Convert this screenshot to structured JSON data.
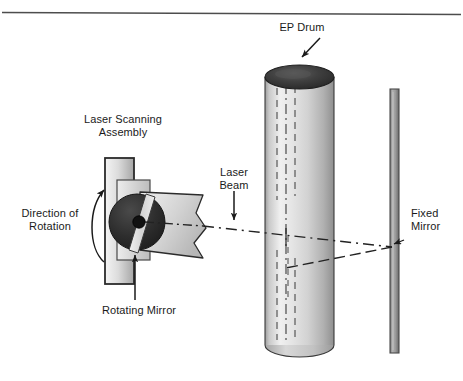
{
  "figure": {
    "background_color": "#ffffff",
    "rule_color": "#4d4d4d",
    "ink_color": "#1a1a1a"
  },
  "labels": {
    "ep_drum": "EP Drum",
    "laser_scanning_assembly_line1": "Laser Scanning",
    "laser_scanning_assembly_line2": "Assembly",
    "laser_beam_line1": "Laser",
    "laser_beam_line2": "Beam",
    "direction_of_rotation_line1": "Direction of",
    "direction_of_rotation_line2": "Rotation",
    "rotating_mirror": "Rotating Mirror",
    "fixed_mirror_line1": "Fixed",
    "fixed_mirror_line2": "Mirror"
  },
  "parts": {
    "ep_drum": {
      "name": "EP Drum",
      "shape": "cylinder",
      "top_cap_color": "#3b3b3b",
      "body_light": "#efefef",
      "body_mid": "#d9d9d9",
      "body_dark": "#9a9a9a",
      "outline": "#3a3a3a"
    },
    "fixed_mirror": {
      "name": "Fixed Mirror",
      "shape": "vertical-bar",
      "fill_light": "#b8b8b8",
      "fill_dark": "#7c7c7c",
      "outline": "#4a4a4a"
    },
    "rotating_mirror": {
      "name": "Rotating Mirror",
      "shape": "polygon-mirror-disc",
      "disc_color": "#2e2e2e",
      "facet_color": "#d8d8d8",
      "hub_color": "#111111"
    },
    "scanning_housing": {
      "name": "Laser Scanning Assembly housing",
      "shape": "vertical-rectangle",
      "fill_light": "#f2f2f2",
      "fill_dark": "#a8a8a8",
      "outline": "#2b2b2b"
    },
    "beam_fan": {
      "name": "Laser beam fan",
      "fill_light": "#e8e8e8",
      "fill_dark": "#b0b0b0",
      "outline": "#2b2b2b"
    },
    "beam_path": {
      "name": "Laser beam path",
      "style": "dash-dot",
      "color": "#222222"
    }
  }
}
